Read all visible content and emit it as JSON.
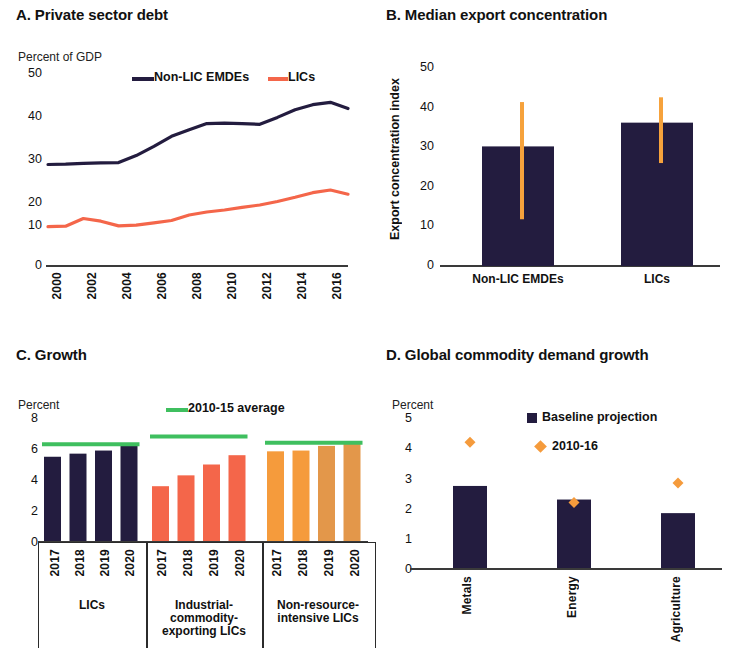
{
  "colors": {
    "navy": "#231c3f",
    "coral": "#f4664a",
    "orange_light": "#f59b3c",
    "orange_mid": "#e3974a",
    "orange_whisker": "#f6a23c",
    "green": "#3fbf5f",
    "axis": "#3a3a3a",
    "text": "#111111"
  },
  "panels": {
    "a": {
      "title": "A. Private sector debt",
      "unit": "Percent of GDP",
      "yticks": [
        "50",
        "40",
        "30",
        "20",
        "10",
        "0"
      ],
      "legend": [
        {
          "label": "Non-LIC EMDEs",
          "color": "#231c3f"
        },
        {
          "label": "LICs",
          "color": "#f4664a"
        }
      ]
    },
    "b": {
      "title": "B. Median export concentration",
      "ylabel": "Export concentration index",
      "yticks": [
        "50",
        "40",
        "30",
        "20",
        "10",
        "0"
      ],
      "xticks": [
        "Non-LIC EMDEs",
        "LICs"
      ]
    },
    "c": {
      "title": "C. Growth",
      "unit": "Percent",
      "yticks": [
        "8",
        "6",
        "4",
        "2",
        "0"
      ],
      "legend": [
        {
          "label": "2010-15 average",
          "color": "#3fbf5f"
        }
      ],
      "groups": [
        {
          "label": "LICs",
          "years": [
            "2017",
            "2018",
            "2019",
            "2020"
          ]
        },
        {
          "label": "Industrial-commodity-exporting LICs",
          "years": [
            "2017",
            "2018",
            "2019",
            "2020"
          ]
        },
        {
          "label": "Non-resource-intensive LICs",
          "years": [
            "2017",
            "2018",
            "2019",
            "2020"
          ]
        }
      ]
    },
    "d": {
      "title": "D. Global commodity demand growth",
      "unit": "Percent",
      "yticks": [
        "5",
        "4",
        "3",
        "2",
        "1",
        "0"
      ],
      "legend": [
        {
          "label": "Baseline projection",
          "color": "#231c3f",
          "marker": "square"
        },
        {
          "label": "2010-16",
          "color": "#f59b3c",
          "marker": "diamond"
        }
      ],
      "xticks": [
        "Metals",
        "Energy",
        "Agriculture"
      ]
    }
  },
  "chart_data": [
    {
      "type": "line",
      "panel": "A",
      "title": "A. Private sector debt",
      "xlabel": "",
      "ylabel": "Percent of GDP",
      "ylim": [
        0,
        50
      ],
      "grid": false,
      "legend_position": "top",
      "x": [
        2000,
        2001,
        2002,
        2003,
        2004,
        2005,
        2006,
        2007,
        2008,
        2009,
        2010,
        2011,
        2012,
        2013,
        2014,
        2015,
        2016,
        2017
      ],
      "xtick_labels": [
        "2000",
        "2002",
        "2004",
        "2006",
        "2008",
        "2010",
        "2012",
        "2014",
        "2016"
      ],
      "series": [
        {
          "name": "Non-LIC EMDEs",
          "color": "#231c3f",
          "values": [
            26.3,
            26.4,
            26.6,
            26.7,
            26.8,
            28.6,
            31.0,
            33.6,
            35.3,
            36.9,
            37.0,
            36.9,
            36.7,
            38.5,
            40.5,
            41.8,
            42.4,
            40.8
          ]
        },
        {
          "name": "LICs",
          "color": "#f4664a",
          "values": [
            10.2,
            10.3,
            12.3,
            11.6,
            10.4,
            10.6,
            11.2,
            11.8,
            13.2,
            14.0,
            14.5,
            15.2,
            15.8,
            16.7,
            17.8,
            19.0,
            19.7,
            18.6
          ]
        }
      ]
    },
    {
      "type": "bar",
      "panel": "B",
      "title": "B. Median export concentration",
      "xlabel": "",
      "ylabel": "Export concentration index",
      "ylim": [
        0,
        50
      ],
      "grid": false,
      "categories": [
        "Non-LIC EMDEs",
        "LICs"
      ],
      "values": [
        30.2,
        36.2
      ],
      "bar_color": "#231c3f",
      "error_bars": {
        "color": "#f6a23c",
        "low": [
          11.8,
          26.0
        ],
        "high": [
          41.4,
          42.6
        ]
      }
    },
    {
      "type": "bar",
      "panel": "C",
      "title": "C. Growth",
      "xlabel": "",
      "ylabel": "Percent",
      "ylim": [
        0,
        8
      ],
      "grid": false,
      "categories": [
        "2017",
        "2018",
        "2019",
        "2020",
        "2017",
        "2018",
        "2019",
        "2020",
        "2017",
        "2018",
        "2019",
        "2020"
      ],
      "groups": [
        {
          "name": "LICs",
          "categories": [
            "2017",
            "2018",
            "2019",
            "2020"
          ],
          "values": [
            5.5,
            5.7,
            5.9,
            6.2
          ],
          "colors": [
            "#231c3f",
            "#231c3f",
            "#231c3f",
            "#231c3f"
          ],
          "average_2010_15": 6.3
        },
        {
          "name": "Industrial-commodity-exporting LICs",
          "categories": [
            "2017",
            "2018",
            "2019",
            "2020"
          ],
          "values": [
            3.6,
            4.3,
            5.0,
            5.6
          ],
          "colors": [
            "#f4664a",
            "#f4664a",
            "#f4664a",
            "#f4664a"
          ],
          "average_2010_15": 6.8
        },
        {
          "name": "Non-resource-intensive LICs",
          "categories": [
            "2017",
            "2018",
            "2019",
            "2020"
          ],
          "values": [
            5.85,
            5.9,
            6.2,
            6.45
          ],
          "colors": [
            "#f59b3c",
            "#f59b3c",
            "#e3974a",
            "#e3974a"
          ],
          "average_2010_15": 6.4
        }
      ],
      "legend": [
        "2010-15 average"
      ]
    },
    {
      "type": "bar",
      "panel": "D",
      "title": "D. Global commodity demand growth",
      "xlabel": "",
      "ylabel": "Percent",
      "ylim": [
        0,
        5
      ],
      "grid": false,
      "categories": [
        "Metals",
        "Energy",
        "Agriculture"
      ],
      "series": [
        {
          "name": "Baseline projection",
          "type": "bar",
          "color": "#231c3f",
          "values": [
            2.75,
            2.3,
            1.85
          ]
        },
        {
          "name": "2010-16",
          "type": "marker",
          "marker": "diamond",
          "color": "#f59b3c",
          "values": [
            4.2,
            2.2,
            2.85
          ]
        }
      ]
    }
  ]
}
